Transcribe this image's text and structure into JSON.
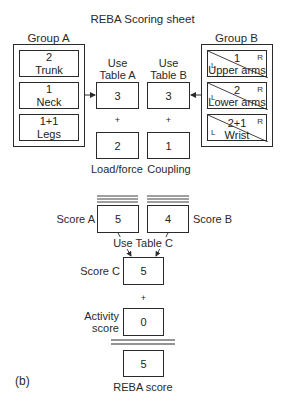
{
  "title": "REBA  Scoring sheet",
  "group_a": {
    "label": "Group A",
    "items": [
      {
        "value": "2",
        "name": "Trunk"
      },
      {
        "value": "1",
        "name": "Neck"
      },
      {
        "value": "1+1",
        "name": "Legs"
      }
    ]
  },
  "group_b": {
    "label": "Group B",
    "items": [
      {
        "value": "1",
        "name": "Upper arms",
        "left": "L",
        "right": "R"
      },
      {
        "value": "2",
        "name": "Lower arms",
        "left": "L",
        "right": "R"
      },
      {
        "value": "2+1",
        "name": "Wrist",
        "left": "L",
        "right": "R"
      }
    ]
  },
  "table_a": {
    "label_line1": "Use",
    "label_line2": "Table A",
    "value": "3"
  },
  "table_b": {
    "label_line1": "Use",
    "label_line2": "Table B",
    "value": "3"
  },
  "plus": "+",
  "load_force": {
    "label": "Load/force",
    "value": "2"
  },
  "coupling": {
    "label": "Coupling",
    "value": "1"
  },
  "score_a": {
    "label": "Score A",
    "value": "5"
  },
  "score_b": {
    "label": "Score B",
    "value": "4"
  },
  "use_table_c": "Use Table C",
  "score_c": {
    "label": "Score C",
    "value": "5"
  },
  "activity": {
    "label_line1": "Activity",
    "label_line2": "score",
    "value": "0"
  },
  "reba": {
    "label": "REBA score",
    "value": "5"
  },
  "panel_label": "(b)"
}
